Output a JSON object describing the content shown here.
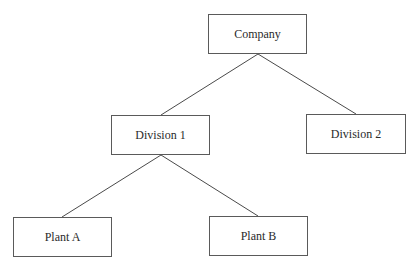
{
  "diagram": {
    "type": "org-chart",
    "nodes": [
      {
        "id": "company",
        "label": "Company",
        "x": 208,
        "y": 14,
        "w": 99,
        "h": 40
      },
      {
        "id": "division1",
        "label": "Division 1",
        "x": 111,
        "y": 115,
        "w": 99,
        "h": 40
      },
      {
        "id": "division2",
        "label": "Division 2",
        "x": 306,
        "y": 114,
        "w": 100,
        "h": 40
      },
      {
        "id": "plantA",
        "label": "Plant A",
        "x": 13,
        "y": 217,
        "w": 99,
        "h": 40
      },
      {
        "id": "plantB",
        "label": "Plant B",
        "x": 209,
        "y": 216,
        "w": 99,
        "h": 40
      }
    ],
    "edges": [
      {
        "from": "company",
        "to": "division1"
      },
      {
        "from": "company",
        "to": "division2"
      },
      {
        "from": "division1",
        "to": "plantA"
      },
      {
        "from": "division1",
        "to": "plantB"
      }
    ],
    "line_color": "#4a4a4a"
  }
}
